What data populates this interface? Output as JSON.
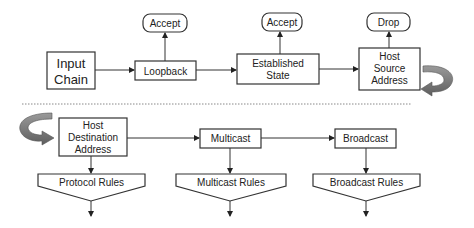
{
  "diagram": {
    "top_row": {
      "input_chain": [
        "Input",
        "Chain"
      ],
      "loopback": "Loopback",
      "established_state": [
        "Established",
        "State"
      ],
      "host_source_address": [
        "Host",
        "Source",
        "Address"
      ],
      "accept_1": "Accept",
      "accept_2": "Accept",
      "drop": "Drop"
    },
    "bottom_row": {
      "host_destination_address": [
        "Host",
        "Destination",
        "Address"
      ],
      "multicast": "Multicast",
      "broadcast": "Broadcast",
      "protocol_rules": "Protocol Rules",
      "multicast_rules": "Multicast Rules",
      "broadcast_rules": "Broadcast Rules"
    },
    "colors": {
      "stroke": "#333333",
      "curved_arrow": "#7a7a7a",
      "divider": "#888888"
    }
  }
}
